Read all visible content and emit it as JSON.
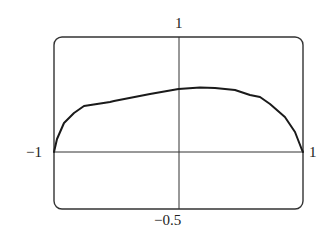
{
  "chart_data": {
    "type": "line",
    "title": "",
    "xlabel": "",
    "ylabel": "",
    "xlim": [
      -1,
      1
    ],
    "ylim": [
      -0.5,
      1
    ],
    "grid": false,
    "axes_through_origin": true,
    "tick_labels": {
      "x_left": "−1",
      "x_right": "1",
      "y_top": "1",
      "y_bottom": "−0.5"
    },
    "series": [
      {
        "name": "curve",
        "color": "#1a1a1a",
        "x": [
          -1,
          -0.976,
          -0.92,
          -0.839,
          -0.759,
          -0.55,
          -0.518,
          -0.229,
          0,
          0.173,
          0.293,
          0.454,
          0.574,
          0.655,
          0.735,
          0.855,
          0.936,
          0.992,
          1
        ],
        "y": [
          0,
          0.113,
          0.252,
          0.339,
          0.4,
          0.435,
          0.443,
          0.504,
          0.548,
          0.561,
          0.557,
          0.539,
          0.496,
          0.478,
          0.417,
          0.304,
          0.174,
          0.017,
          0
        ]
      }
    ]
  }
}
